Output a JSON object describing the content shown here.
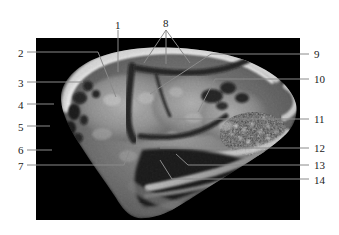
{
  "figure": {
    "type": "anatomical-scan",
    "modality": "sagittal-section-scan",
    "background_color": "#ffffff",
    "scan_background_color": "#000000",
    "scan_frame": {
      "x": 36,
      "y": 38,
      "width": 264,
      "height": 182
    },
    "leader_line_color": "#8a8a8a",
    "label_text_color": "#1a1a1a"
  },
  "labels": {
    "top": [
      {
        "id": "1",
        "text": "1",
        "x": 115,
        "y": 20,
        "anchor": "start"
      },
      {
        "id": "8",
        "text": "8",
        "x": 163,
        "y": 18,
        "anchor": "start"
      }
    ],
    "left": [
      {
        "id": "2",
        "text": "2",
        "x": 18,
        "y": 48
      },
      {
        "id": "3",
        "text": "3",
        "x": 18,
        "y": 78
      },
      {
        "id": "4",
        "text": "4",
        "x": 18,
        "y": 100
      },
      {
        "id": "5",
        "text": "5",
        "x": 18,
        "y": 122
      },
      {
        "id": "6",
        "text": "6",
        "x": 18,
        "y": 145
      },
      {
        "id": "7",
        "text": "7",
        "x": 18,
        "y": 161
      }
    ],
    "right": [
      {
        "id": "9",
        "text": "9",
        "x": 314,
        "y": 49
      },
      {
        "id": "10",
        "text": "10",
        "x": 314,
        "y": 74
      },
      {
        "id": "11",
        "text": "11",
        "x": 314,
        "y": 114
      },
      {
        "id": "12",
        "text": "12",
        "x": 314,
        "y": 143
      },
      {
        "id": "13",
        "text": "13",
        "x": 314,
        "y": 160
      },
      {
        "id": "14",
        "text": "14",
        "x": 314,
        "y": 175
      }
    ]
  },
  "leader_lines": [
    {
      "for": "1",
      "points": "118,30 118,72"
    },
    {
      "for": "2",
      "points": "27,52 98,52 116,97"
    },
    {
      "for": "3",
      "points": "27,82 83,82"
    },
    {
      "for": "4",
      "points": "27,104 54,104"
    },
    {
      "for": "5",
      "points": "27,126 50,126"
    },
    {
      "for": "6",
      "points": "27,150 52,150"
    },
    {
      "for": "7",
      "points": "27,165 124,165 129,152"
    },
    {
      "for": "8a",
      "points": "166,30 144,63"
    },
    {
      "for": "8b",
      "points": "166,30 166,64"
    },
    {
      "for": "8c",
      "points": "166,30 190,63"
    },
    {
      "for": "9",
      "points": "309,54 211,54 150,94"
    },
    {
      "for": "10",
      "points": "309,79 215,79 198,112"
    },
    {
      "for": "11",
      "points": "309,119 165,119 159,114"
    },
    {
      "for": "12",
      "points": "309,148 160,148"
    },
    {
      "for": "13",
      "points": "309,165 188,165 176,154"
    },
    {
      "for": "14",
      "points": "309,179 172,179 160,160"
    }
  ],
  "scan_content": {
    "description": "Grayscale sagittal scan of a head showing cranial vault, brain tissue, nasal cavity, mandible and soft tissue",
    "regions": [
      {
        "name": "cranial-vault-bone",
        "tone": "bright"
      },
      {
        "name": "brain-parenchyma",
        "tone": "mid-gray"
      },
      {
        "name": "ventricle-dark-band",
        "tone": "dark"
      },
      {
        "name": "occipital-cavities",
        "tone": "dark-speckled"
      },
      {
        "name": "nasal-turbinate-mesh",
        "tone": "speckled"
      },
      {
        "name": "oral-cavity",
        "tone": "black"
      },
      {
        "name": "mandible",
        "tone": "bright"
      },
      {
        "name": "tongue-soft-tissue",
        "tone": "mid-gray"
      }
    ]
  }
}
